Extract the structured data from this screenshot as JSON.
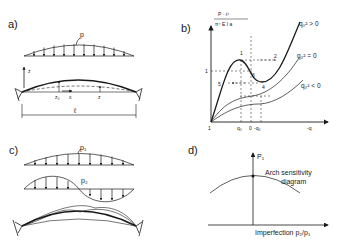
{
  "panels": {
    "a": {
      "label": "a)",
      "load_label": "p",
      "axis_z": "z",
      "axis_x": "x",
      "z0_label": "z₀",
      "z_label": "z",
      "span_label": "ℓ"
    },
    "b": {
      "label": "b)",
      "y_axis_numerator": "P · ℓ⁴",
      "y_axis_denominator": "π⁴ E I a",
      "x_axis_label": "-q",
      "tick_origin": "1",
      "tick_q0": "q₀",
      "tick_zero": "0",
      "tick_neg_q0": "-q₀",
      "y_tick_1": "1",
      "points": [
        "1",
        "2",
        "4",
        "5",
        "6"
      ],
      "curves": [
        {
          "label": "q₀² > 0"
        },
        {
          "label": "q₀² = 0"
        },
        {
          "label": "q₀² < 0"
        }
      ]
    },
    "c": {
      "label": "c)",
      "load1_label": "p₁",
      "load2_label": "p₂"
    },
    "d": {
      "label": "d)",
      "y_axis_label": "P₁",
      "curve_label_line1": "Arch sensitivity",
      "curve_label_line2": "diagram",
      "x_axis_label": "Imperfection  p₂/p₁"
    }
  }
}
